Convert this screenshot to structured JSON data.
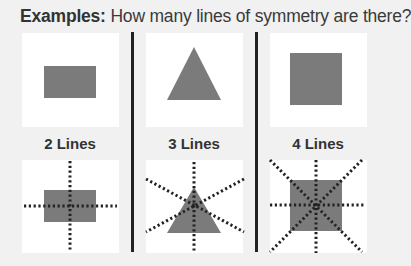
{
  "title": {
    "bold": "Examples:",
    "rest": " How many lines of symmetry are there?"
  },
  "colors": {
    "background": "#f1f1f1",
    "box": "#ffffff",
    "shape": "#7b7b7b",
    "divider": "#222222",
    "dots": "#222222"
  },
  "examples": [
    {
      "shape": "rectangle",
      "label": "2 Lines",
      "lines_of_symmetry": 2
    },
    {
      "shape": "equilateral-triangle",
      "label": "3 Lines",
      "lines_of_symmetry": 3
    },
    {
      "shape": "square",
      "label": "4 Lines",
      "lines_of_symmetry": 4
    }
  ]
}
